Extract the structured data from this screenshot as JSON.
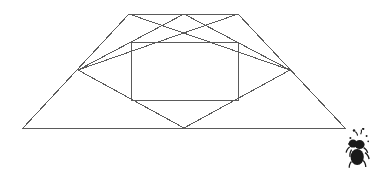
{
  "figure": {
    "background_color": "#ffffff",
    "stroke_color": "#5a5a5a",
    "stroke_width": 1,
    "canvas": {
      "width": 376,
      "height": 171
    },
    "shapes": [
      {
        "name": "outer-trapezoid",
        "type": "polygon",
        "points": "129,14 238,14 345,128 23,128"
      },
      {
        "name": "inner-rectangle",
        "type": "polygon",
        "points": "131,42 238,42 238,100 131,100"
      },
      {
        "name": "inner-rhombus",
        "type": "polygon",
        "points": "184,14 290,70 184,128 78,70"
      },
      {
        "name": "diagonal-upper-left",
        "type": "polyline",
        "points": "129,14 290,70"
      },
      {
        "name": "diagonal-upper-right",
        "type": "polyline",
        "points": "238,14 78,70"
      }
    ],
    "vertices": {
      "trapezoid_top_left": [
        129,
        14
      ],
      "trapezoid_top_right": [
        238,
        14
      ],
      "trapezoid_bottom_right": [
        345,
        128
      ],
      "trapezoid_bottom_left": [
        23,
        128
      ],
      "rectangle_top_left": [
        131,
        42
      ],
      "rectangle_top_right": [
        238,
        42
      ],
      "rectangle_bottom_right": [
        238,
        100
      ],
      "rectangle_bottom_left": [
        131,
        100
      ],
      "rhombus_top": [
        184,
        14
      ],
      "rhombus_right": [
        290,
        70
      ],
      "rhombus_bottom": [
        184,
        128
      ],
      "rhombus_left": [
        78,
        70
      ]
    }
  },
  "logo": {
    "name": "ant-logo",
    "color": "#1a1a1a",
    "label": "ant"
  },
  "watermark": {
    "text": "",
    "color": "#fbfbfb"
  }
}
